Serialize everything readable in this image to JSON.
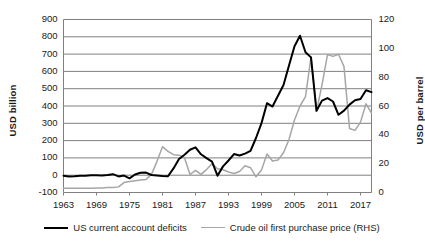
{
  "chart_data": {
    "type": "line",
    "title": "",
    "xlabel": "",
    "ylabel": "USD billion",
    "y2label": "USD per barrel",
    "grid": true,
    "legend_position": "bottom",
    "xlim": [
      1963,
      2019
    ],
    "ylim": [
      -100,
      900
    ],
    "y2lim": [
      0,
      120
    ],
    "ytick_labels": [
      "900",
      "800",
      "700",
      "600",
      "500",
      "400",
      "300",
      "200",
      "100",
      "0",
      "-100"
    ],
    "ytick_values": [
      900,
      800,
      700,
      600,
      500,
      400,
      300,
      200,
      100,
      0,
      -100
    ],
    "y2tick_labels": [
      "120",
      "100",
      "80",
      "60",
      "40",
      "20",
      "0"
    ],
    "y2tick_values": [
      120,
      100,
      80,
      60,
      40,
      20,
      0
    ],
    "xtick_labels": [
      "1963",
      "1969",
      "1975",
      "1981",
      "1987",
      "1993",
      "1999",
      "2005",
      "2011",
      "2017"
    ],
    "xtick_values": [
      1963,
      1969,
      1975,
      1981,
      1987,
      1993,
      1999,
      2005,
      2011,
      2017
    ],
    "x": [
      1963,
      1964,
      1965,
      1966,
      1967,
      1968,
      1969,
      1970,
      1971,
      1972,
      1973,
      1974,
      1975,
      1976,
      1977,
      1978,
      1979,
      1980,
      1981,
      1982,
      1983,
      1984,
      1985,
      1986,
      1987,
      1988,
      1989,
      1990,
      1991,
      1992,
      1993,
      1994,
      1995,
      1996,
      1997,
      1998,
      1999,
      2000,
      2001,
      2002,
      2003,
      2004,
      2005,
      2006,
      2007,
      2008,
      2009,
      2010,
      2011,
      2012,
      2013,
      2014,
      2015,
      2016,
      2017,
      2018,
      2019
    ],
    "series": [
      {
        "name": "US current account deficits",
        "axis": "left",
        "color": "#000000",
        "unit": "USD billion",
        "values": [
          -3,
          -7,
          -6,
          -3,
          -3,
          -1,
          -1,
          -2,
          1,
          6,
          -7,
          -2,
          -18,
          4,
          14,
          15,
          1,
          -2,
          -5,
          -6,
          39,
          94,
          118,
          147,
          161,
          121,
          99,
          79,
          -3,
          51,
          85,
          122,
          114,
          125,
          141,
          215,
          301,
          416,
          397,
          459,
          521,
          634,
          745,
          806,
          711,
          681,
          372,
          431,
          446,
          426,
          349,
          373,
          408,
          433,
          440,
          491,
          480
        ]
      },
      {
        "name": "Crude oil first purchase price (RHS)",
        "axis": "right",
        "color": "#a6a6a6",
        "unit": "USD per barrel",
        "values": [
          2.9,
          2.9,
          2.9,
          2.9,
          2.9,
          2.9,
          3.1,
          3.2,
          3.4,
          3.4,
          3.9,
          6.9,
          7.7,
          8.2,
          8.6,
          9.0,
          12.6,
          21.6,
          31.8,
          28.5,
          26.2,
          25.9,
          24.1,
          12.5,
          15.4,
          12.6,
          15.9,
          20.0,
          16.5,
          15.8,
          14.2,
          13.2,
          14.6,
          18.5,
          17.2,
          10.9,
          15.6,
          26.7,
          21.8,
          22.5,
          27.6,
          36.8,
          50.3,
          60.0,
          66.5,
          94.0,
          56.3,
          74.7,
          95.7,
          94.4,
          95.9,
          87.3,
          44.4,
          43.1,
          48.8,
          61.5,
          55.0
        ]
      }
    ]
  },
  "legend": {
    "items": [
      {
        "label": "US current account deficits",
        "style": "black-solid"
      },
      {
        "label": "Crude oil first purchase price (RHS)",
        "style": "gray-solid"
      }
    ]
  }
}
